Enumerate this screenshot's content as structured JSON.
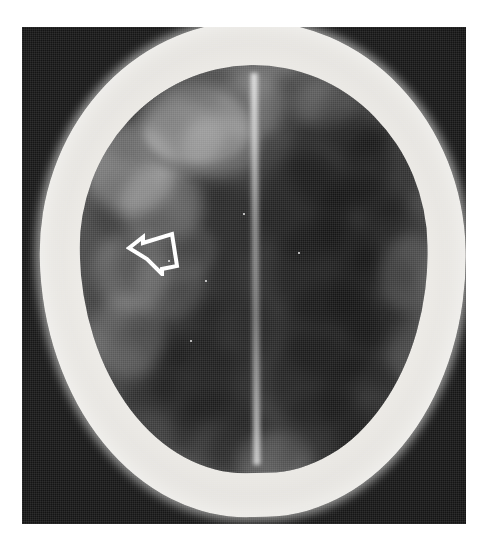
{
  "image": {
    "modality": "CT",
    "view": "axial",
    "region": "head",
    "title": "Axial head CT",
    "width_px": 491,
    "height_px": 537
  },
  "page": {
    "background_color": "#ffffff",
    "margin_left_px": 22,
    "margin_top_px": 27
  },
  "plate": {
    "name": "ct-background-plate",
    "background_color": "#161616",
    "left_px": 22,
    "top_px": 27,
    "width_px": 444,
    "height_px": 497
  },
  "anatomy": {
    "skull": {
      "label": "skull",
      "color": "#f1f1ee",
      "description": "bright ovoid bone ring"
    },
    "brain": {
      "label": "brain parenchyma",
      "color_light": "#8f8f8f",
      "color_dark": "#454545",
      "description": "mottled gray cerebral tissue"
    },
    "falx": {
      "label": "interhemispheric fissure",
      "color": "#e0e0e0",
      "description": "vertical bright midline band"
    },
    "frontal_lesion": {
      "label": "ring lesion, frontal",
      "color": "#464646"
    },
    "target_lesion": {
      "label": "hypodense lesion",
      "color": "#3c3c3c"
    }
  },
  "annotations": {
    "arrow": {
      "name": "open-arrow-marker",
      "shape": "hollow-outline-arrow",
      "direction": "left",
      "stroke_color": "#ffffff",
      "fill_color": "none",
      "x_px": 126,
      "y_px": 228,
      "width_px": 56,
      "height_px": 48
    }
  },
  "blobs_dark": [
    {
      "l": 6,
      "t": 6,
      "w": 26,
      "h": 18,
      "o": 0.38
    },
    {
      "l": 14,
      "t": 2,
      "w": 22,
      "h": 14,
      "o": 0.3
    },
    {
      "l": 30,
      "t": 0,
      "w": 18,
      "h": 15,
      "o": 0.26
    },
    {
      "l": 55,
      "t": 1,
      "w": 24,
      "h": 17,
      "o": 0.34
    },
    {
      "l": 70,
      "t": 3,
      "w": 22,
      "h": 20,
      "o": 0.42
    },
    {
      "l": 60,
      "t": 12,
      "w": 30,
      "h": 24,
      "o": 0.46
    },
    {
      "l": 76,
      "t": 16,
      "w": 22,
      "h": 22,
      "o": 0.4
    },
    {
      "l": 52,
      "t": 22,
      "w": 26,
      "h": 26,
      "o": 0.44
    },
    {
      "l": 68,
      "t": 28,
      "w": 26,
      "h": 22,
      "o": 0.38
    },
    {
      "l": 80,
      "t": 34,
      "w": 20,
      "h": 22,
      "o": 0.34
    },
    {
      "l": 56,
      "t": 38,
      "w": 30,
      "h": 26,
      "o": 0.42
    },
    {
      "l": 72,
      "t": 46,
      "w": 26,
      "h": 24,
      "o": 0.4
    },
    {
      "l": 58,
      "t": 54,
      "w": 28,
      "h": 24,
      "o": 0.38
    },
    {
      "l": 76,
      "t": 58,
      "w": 22,
      "h": 22,
      "o": 0.34
    },
    {
      "l": 54,
      "t": 66,
      "w": 26,
      "h": 24,
      "o": 0.4
    },
    {
      "l": 68,
      "t": 72,
      "w": 26,
      "h": 22,
      "o": 0.36
    },
    {
      "l": 58,
      "t": 80,
      "w": 24,
      "h": 20,
      "o": 0.34
    },
    {
      "l": 72,
      "t": 84,
      "w": 22,
      "h": 18,
      "o": 0.3
    },
    {
      "l": 4,
      "t": 26,
      "w": 22,
      "h": 18,
      "o": 0.26
    },
    {
      "l": 10,
      "t": 36,
      "w": 24,
      "h": 20,
      "o": 0.3
    },
    {
      "l": 2,
      "t": 46,
      "w": 22,
      "h": 22,
      "o": 0.28
    },
    {
      "l": 14,
      "t": 52,
      "w": 26,
      "h": 22,
      "o": 0.32
    },
    {
      "l": 6,
      "t": 62,
      "w": 24,
      "h": 22,
      "o": 0.3
    },
    {
      "l": 20,
      "t": 66,
      "w": 24,
      "h": 22,
      "o": 0.34
    },
    {
      "l": 10,
      "t": 76,
      "w": 24,
      "h": 20,
      "o": 0.32
    },
    {
      "l": 26,
      "t": 80,
      "w": 26,
      "h": 20,
      "o": 0.34
    },
    {
      "l": 36,
      "t": 86,
      "w": 26,
      "h": 18,
      "o": 0.32
    },
    {
      "l": 56,
      "t": 90,
      "w": 24,
      "h": 16,
      "o": 0.28
    },
    {
      "l": 26,
      "t": 18,
      "w": 20,
      "h": 16,
      "o": 0.24
    },
    {
      "l": 32,
      "t": 30,
      "w": 22,
      "h": 18,
      "o": 0.26
    },
    {
      "l": 24,
      "t": 44,
      "w": 22,
      "h": 18,
      "o": 0.26
    },
    {
      "l": 34,
      "t": 56,
      "w": 22,
      "h": 18,
      "o": 0.24
    },
    {
      "l": 30,
      "t": 70,
      "w": 22,
      "h": 18,
      "o": 0.26
    }
  ],
  "blobs_light": [
    {
      "l": 2,
      "t": 14,
      "w": 26,
      "h": 22,
      "o": 0.3
    },
    {
      "l": 12,
      "t": 24,
      "w": 24,
      "h": 20,
      "o": 0.26
    },
    {
      "l": 4,
      "t": 40,
      "w": 22,
      "h": 20,
      "o": 0.22
    },
    {
      "l": 18,
      "t": 8,
      "w": 24,
      "h": 18,
      "o": 0.28
    },
    {
      "l": 30,
      "t": 12,
      "w": 22,
      "h": 16,
      "o": 0.24
    },
    {
      "l": 2,
      "t": 56,
      "w": 22,
      "h": 20,
      "o": 0.2
    },
    {
      "l": 16,
      "t": 44,
      "w": 20,
      "h": 18,
      "o": 0.18
    },
    {
      "l": 40,
      "t": 2,
      "w": 20,
      "h": 16,
      "o": 0.22
    },
    {
      "l": 44,
      "t": 90,
      "w": 22,
      "h": 14,
      "o": 0.18
    },
    {
      "l": 86,
      "t": 42,
      "w": 18,
      "h": 20,
      "o": 0.16
    },
    {
      "l": 88,
      "t": 62,
      "w": 16,
      "h": 18,
      "o": 0.14
    },
    {
      "l": 62,
      "t": 4,
      "w": 18,
      "h": 12,
      "o": 0.16
    }
  ],
  "specks": [
    {
      "l": 205,
      "t": 280,
      "s": 2
    },
    {
      "l": 190,
      "t": 340,
      "s": 2
    },
    {
      "l": 298,
      "t": 252,
      "s": 2
    },
    {
      "l": 243,
      "t": 213,
      "s": 2
    },
    {
      "l": 168,
      "t": 260,
      "s": 2
    }
  ]
}
